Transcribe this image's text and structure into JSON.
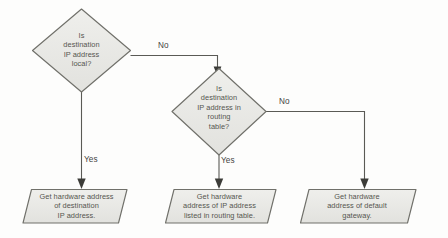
{
  "diagram": {
    "background_color": "#fdfdfc",
    "shape_fill": "#e9e9e6",
    "shape_stroke": "#6f6f69",
    "text_color": "#55554f",
    "line_color": "#5a5a55",
    "nodes": [
      {
        "id": "decision-local",
        "type": "decision",
        "text": "Is\ndestination\nIP address\nlocal?"
      },
      {
        "id": "decision-routing-table",
        "type": "decision",
        "text": "Is\ndestination\nIP address in\nrouting\ntable?"
      },
      {
        "id": "process-destination",
        "type": "data",
        "text": "Get hardware address\nof destination\nIP address."
      },
      {
        "id": "process-routing-table",
        "type": "data",
        "text": "Get hardware\naddress of IP address\nlisted in routing table."
      },
      {
        "id": "process-default-gateway",
        "type": "data",
        "text": "Get hardware\naddress of default\ngateway."
      }
    ],
    "edges": [
      {
        "id": "edge-local-no",
        "label": "No",
        "from": "decision-local",
        "to": "decision-routing-table"
      },
      {
        "id": "edge-local-yes",
        "label": "Yes",
        "from": "decision-local",
        "to": "process-destination"
      },
      {
        "id": "edge-routing-yes",
        "label": "Yes",
        "from": "decision-routing-table",
        "to": "process-routing-table"
      },
      {
        "id": "edge-routing-no",
        "label": "No",
        "from": "decision-routing-table",
        "to": "process-default-gateway"
      }
    ]
  }
}
